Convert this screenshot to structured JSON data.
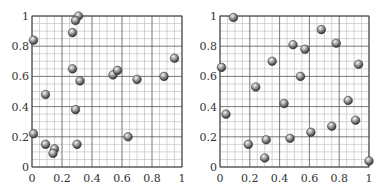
{
  "chart_data": [
    {
      "type": "scatter",
      "title": "",
      "xlabel": "",
      "ylabel": "",
      "xlim": [
        0,
        1
      ],
      "ylim": [
        0,
        1
      ],
      "grid": true,
      "grid_minor_step": 0.05,
      "grid_major_step": 0.2,
      "x_ticks": [
        "0",
        "0.2",
        "0.4",
        "0.6",
        "0.8",
        "1"
      ],
      "y_ticks": [
        "0",
        "0.2",
        "0.4",
        "0.6",
        "0.8",
        "1"
      ],
      "marker": "shaded-sphere",
      "points": [
        [
          0.31,
          1.0
        ],
        [
          0.29,
          0.97
        ],
        [
          0.27,
          0.89
        ],
        [
          0.01,
          0.84
        ],
        [
          0.27,
          0.65
        ],
        [
          0.32,
          0.57
        ],
        [
          0.54,
          0.61
        ],
        [
          0.57,
          0.64
        ],
        [
          0.7,
          0.58
        ],
        [
          0.88,
          0.6
        ],
        [
          0.95,
          0.72
        ],
        [
          0.09,
          0.48
        ],
        [
          0.29,
          0.38
        ],
        [
          0.01,
          0.22
        ],
        [
          0.09,
          0.15
        ],
        [
          0.15,
          0.12
        ],
        [
          0.14,
          0.09
        ],
        [
          0.3,
          0.15
        ],
        [
          0.64,
          0.2
        ]
      ]
    },
    {
      "type": "scatter",
      "title": "",
      "xlabel": "",
      "ylabel": "",
      "xlim": [
        0,
        1
      ],
      "ylim": [
        0,
        1
      ],
      "grid": true,
      "grid_minor_step": 0.05,
      "grid_major_step": 0.2,
      "x_ticks": [
        "0",
        "0.2",
        "0.4",
        "0.6",
        "0.8",
        "1"
      ],
      "y_ticks": [
        "0",
        "0.2",
        "0.4",
        "0.6",
        "0.8",
        "1"
      ],
      "marker": "shaded-sphere",
      "points": [
        [
          0.09,
          0.99
        ],
        [
          0.68,
          0.91
        ],
        [
          0.78,
          0.82
        ],
        [
          0.49,
          0.81
        ],
        [
          0.57,
          0.78
        ],
        [
          0.01,
          0.66
        ],
        [
          0.35,
          0.7
        ],
        [
          0.93,
          0.68
        ],
        [
          0.54,
          0.6
        ],
        [
          0.24,
          0.53
        ],
        [
          0.43,
          0.42
        ],
        [
          0.86,
          0.44
        ],
        [
          0.04,
          0.35
        ],
        [
          0.91,
          0.31
        ],
        [
          0.75,
          0.27
        ],
        [
          0.61,
          0.23
        ],
        [
          0.47,
          0.19
        ],
        [
          0.31,
          0.18
        ],
        [
          0.19,
          0.15
        ],
        [
          0.3,
          0.06
        ],
        [
          1.0,
          0.04
        ]
      ]
    }
  ],
  "colors": {
    "grid_minor": "#b8b8b8",
    "grid_major": "#555555",
    "sphere_light": "#f4f4f4",
    "sphere_mid": "#9a9a9a",
    "sphere_dark": "#3a3a3a"
  }
}
